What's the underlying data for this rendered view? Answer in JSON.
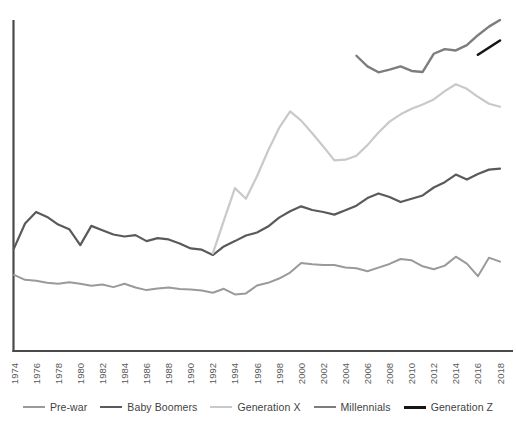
{
  "chart_data": {
    "type": "line",
    "title": "",
    "subtitle": "",
    "xlabel": "",
    "ylabel": "",
    "grid": false,
    "legend_position": "bottom",
    "xlim": [
      1974,
      2018
    ],
    "ylim": [
      0,
      100
    ],
    "x_tick_step": 2,
    "x_ticks": [
      1974,
      1976,
      1978,
      1980,
      1982,
      1984,
      1986,
      1988,
      1990,
      1992,
      1994,
      1996,
      1998,
      2000,
      2002,
      2004,
      2006,
      2008,
      2010,
      2012,
      2014,
      2016,
      2018
    ],
    "y_ticks": [],
    "series": [
      {
        "name": "Pre-war",
        "color": "#9a9a9a",
        "width": 2.0,
        "x": [
          1974,
          1975,
          1976,
          1977,
          1978,
          1979,
          1980,
          1981,
          1982,
          1983,
          1984,
          1985,
          1986,
          1987,
          1988,
          1989,
          1990,
          1991,
          1992,
          1993,
          1994,
          1995,
          1996,
          1997,
          1998,
          1999,
          2000,
          2001,
          2002,
          2003,
          2004,
          2005,
          2006,
          2007,
          2008,
          2009,
          2010,
          2011,
          2012,
          2013,
          2014,
          2015,
          2016,
          2017,
          2018
        ],
        "values": [
          23.0,
          21.5,
          21.2,
          20.6,
          20.3,
          20.8,
          20.3,
          19.7,
          20.1,
          19.3,
          20.3,
          19.2,
          18.4,
          18.9,
          19.2,
          18.7,
          18.6,
          18.3,
          17.6,
          18.8,
          17.1,
          17.4,
          19.8,
          20.6,
          21.9,
          23.7,
          26.6,
          26.2,
          26.0,
          26.0,
          25.2,
          25.0,
          24.1,
          25.2,
          26.3,
          27.8,
          27.4,
          25.6,
          24.7,
          25.8,
          28.5,
          26.4,
          22.6,
          28.2,
          27.0
        ]
      },
      {
        "name": "Baby Boomers",
        "color": "#5a5a5a",
        "width": 2.2,
        "x": [
          1974,
          1975,
          1976,
          1977,
          1978,
          1979,
          1980,
          1981,
          1982,
          1983,
          1984,
          1985,
          1986,
          1987,
          1988,
          1989,
          1990,
          1991,
          1992,
          1993,
          1994,
          1995,
          1996,
          1997,
          1998,
          1999,
          2000,
          2001,
          2002,
          2003,
          2004,
          2005,
          2006,
          2007,
          2008,
          2009,
          2010,
          2011,
          2012,
          2013,
          2014,
          2015,
          2016,
          2017,
          2018
        ],
        "values": [
          31.0,
          38.5,
          42.0,
          40.5,
          38.2,
          36.8,
          32.0,
          37.8,
          36.5,
          35.2,
          34.6,
          35.0,
          33.2,
          34.1,
          33.7,
          32.5,
          31.0,
          30.6,
          29.0,
          31.6,
          33.2,
          34.9,
          35.8,
          37.6,
          40.3,
          42.2,
          43.7,
          42.6,
          42.0,
          41.2,
          42.5,
          43.9,
          46.2,
          47.6,
          46.5,
          45.0,
          46.0,
          47.0,
          49.4,
          51.0,
          53.3,
          51.8,
          53.5,
          54.8,
          55.1
        ]
      },
      {
        "name": "Generation X",
        "color": "#c9c9c9",
        "width": 2.2,
        "x": [
          1992,
          1993,
          1994,
          1995,
          1996,
          1997,
          1998,
          1999,
          2000,
          2001,
          2002,
          2003,
          2004,
          2005,
          2006,
          2007,
          2008,
          2009,
          2010,
          2011,
          2012,
          2013,
          2014,
          2015,
          2016,
          2017,
          2018
        ],
        "values": [
          29.5,
          39.4,
          49.2,
          46.0,
          52.8,
          60.5,
          67.4,
          72.4,
          69.6,
          65.8,
          61.8,
          57.6,
          57.8,
          59.0,
          62.2,
          66.0,
          69.3,
          71.5,
          73.2,
          74.5,
          76.0,
          78.5,
          80.6,
          79.2,
          76.8,
          74.7,
          73.8
        ]
      },
      {
        "name": "Millennials",
        "color": "#7d7d7d",
        "width": 2.4,
        "x": [
          2005,
          2006,
          2007,
          2008,
          2009,
          2010,
          2011,
          2012,
          2013,
          2014,
          2015,
          2016,
          2017,
          2018
        ],
        "values": [
          89.2,
          86.0,
          84.2,
          85.0,
          86.0,
          84.6,
          84.3,
          89.8,
          91.2,
          90.8,
          92.4,
          95.4,
          98.0,
          100.0
        ]
      },
      {
        "name": "Generation Z",
        "color": "#151515",
        "width": 2.6,
        "x": [
          2016,
          2018
        ],
        "values": [
          89.5,
          93.8
        ]
      }
    ]
  },
  "axes": {
    "y_axis_name": "value-axis",
    "x_axis_name": "year-axis"
  },
  "legend": {
    "items": [
      {
        "label": "Pre-war",
        "color": "#9a9a9a",
        "width": "2.2px"
      },
      {
        "label": "Baby Boomers",
        "color": "#5a5a5a",
        "width": "2.6px"
      },
      {
        "label": "Generation X",
        "color": "#c9c9c9",
        "width": "2.4px"
      },
      {
        "label": "Millennials",
        "color": "#7d7d7d",
        "width": "2.4px"
      },
      {
        "label": "Generation Z",
        "color": "#151515",
        "width": "3px"
      }
    ]
  }
}
